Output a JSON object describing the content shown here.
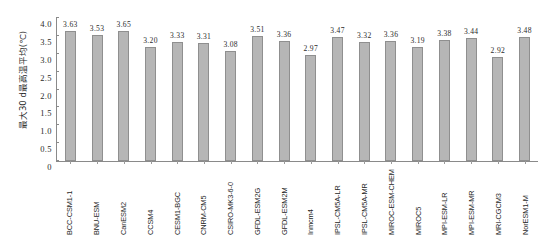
{
  "chart_data": {
    "type": "bar",
    "title": "",
    "xlabel": "",
    "ylabel": "最大30 d最高温平均(℃)",
    "ylim": [
      0,
      4.0
    ],
    "yticks": [
      "0",
      "0.5",
      "1.0",
      "1.5",
      "2.0",
      "2.5",
      "3.0",
      "3.5",
      "4.0"
    ],
    "ytick_values": [
      0,
      0.5,
      1.0,
      1.5,
      2.0,
      2.5,
      3.0,
      3.5,
      4.0
    ],
    "grid": false,
    "legend": null,
    "bar_color": "#b6b6b6",
    "bar_edge_color": "#8f8f8f",
    "axis_color": "#8a8a8a",
    "categories": [
      "BCC-CSM1-1",
      "BNU-ESM",
      "CanESM2",
      "CCSM4",
      "CESM1-BGC",
      "CNRM-CM5",
      "CSIRO-MK3-6-0",
      "GFDL-ESM2G",
      "GFDL-ESM2M",
      "Inmcm4",
      "IPSL-CM5A-LR",
      "IPSL-CM5A-MR",
      "MIROC-ESM-CHEM",
      "MIROC5",
      "MPI-ESM-LR",
      "MPI-ESM-MR",
      "MRI-CGCM3",
      "NorESM1-M"
    ],
    "values": [
      3.63,
      3.53,
      3.65,
      3.2,
      3.33,
      3.31,
      3.08,
      3.51,
      3.36,
      2.97,
      3.47,
      3.32,
      3.36,
      3.19,
      3.38,
      3.44,
      2.92,
      3.48
    ],
    "value_labels": [
      "3.63",
      "3.53",
      "3.65",
      "3.20",
      "3.33",
      "3.31",
      "3.08",
      "3.51",
      "3.36",
      "2.97",
      "3.47",
      "3.32",
      "3.36",
      "3.19",
      "3.38",
      "3.44",
      "2.92",
      "3.48"
    ]
  }
}
